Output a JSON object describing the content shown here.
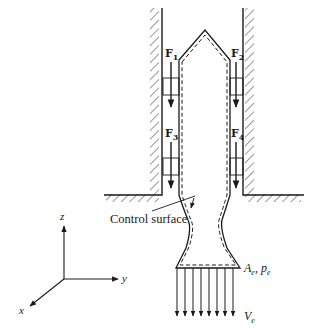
{
  "figure": {
    "type": "control-volume-diagram",
    "forces": [
      {
        "id": "F1",
        "symbol": "F",
        "subscript": "1"
      },
      {
        "id": "F2",
        "symbol": "F",
        "subscript": "2"
      },
      {
        "id": "F3",
        "symbol": "F",
        "subscript": "3"
      },
      {
        "id": "F4",
        "symbol": "F",
        "subscript": "4"
      }
    ],
    "control_surface_label": "Control surface",
    "exit": {
      "area_symbol": "A",
      "area_subscript": "e",
      "separator": ", ",
      "pressure_symbol": "p",
      "pressure_subscript": "e",
      "velocity_symbol": "V",
      "velocity_subscript": "e"
    },
    "axes": {
      "x": "x",
      "y": "y",
      "z": "z"
    },
    "colors": {
      "ink": "#1a1a1a",
      "background": "#ffffff"
    }
  }
}
